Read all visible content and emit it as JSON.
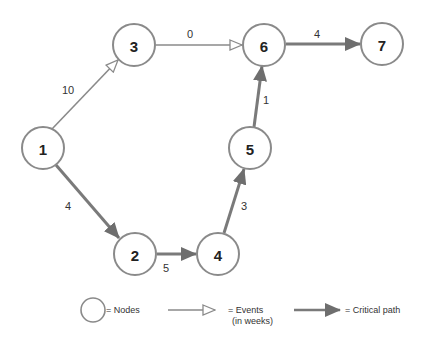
{
  "diagram": {
    "type": "PERT network diagram",
    "colors": {
      "node_stroke": "#8a8a8a",
      "event_line": "#8a8a8a",
      "critical_path": "#7a7a7a",
      "text": "#222222"
    },
    "nodes": [
      {
        "id": "1",
        "label": "1",
        "x": 43,
        "y": 148
      },
      {
        "id": "2",
        "label": "2",
        "x": 135,
        "y": 254
      },
      {
        "id": "3",
        "label": "3",
        "x": 134,
        "y": 45
      },
      {
        "id": "4",
        "label": "4",
        "x": 218,
        "y": 254
      },
      {
        "id": "5",
        "label": "5",
        "x": 250,
        "y": 148
      },
      {
        "id": "6",
        "label": "6",
        "x": 264,
        "y": 45
      },
      {
        "id": "7",
        "label": "7",
        "x": 382,
        "y": 44
      }
    ],
    "edges": [
      {
        "from": "1",
        "to": "3",
        "weight": "10",
        "critical": false
      },
      {
        "from": "3",
        "to": "6",
        "weight": "0",
        "critical": false
      },
      {
        "from": "1",
        "to": "2",
        "weight": "4",
        "critical": true
      },
      {
        "from": "2",
        "to": "4",
        "weight": "5",
        "critical": true
      },
      {
        "from": "4",
        "to": "5",
        "weight": "3",
        "critical": true
      },
      {
        "from": "5",
        "to": "6",
        "weight": "1",
        "critical": true
      },
      {
        "from": "6",
        "to": "7",
        "weight": "4",
        "critical": true
      }
    ],
    "legend": {
      "nodes": "= Nodes",
      "events_line1": "= Events",
      "events_line2": "(in weeks)",
      "critical": "= Critical path"
    }
  }
}
